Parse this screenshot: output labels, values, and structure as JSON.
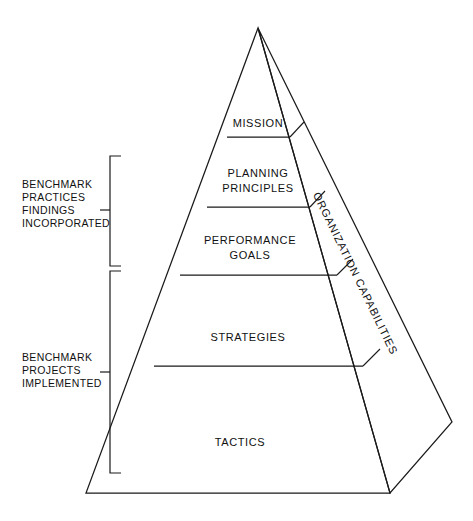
{
  "diagram": {
    "type": "pyramid-hierarchy",
    "tiers": [
      {
        "id": "mission",
        "label": "MISSION",
        "lines": [
          "MISSION"
        ],
        "level": 1
      },
      {
        "id": "planning",
        "label": "PLANNING PRINCIPLES",
        "lines": [
          "PLANNING",
          "PRINCIPLES"
        ],
        "level": 2
      },
      {
        "id": "performance",
        "label": "PERFORMANCE GOALS",
        "lines": [
          "PERFORMANCE",
          "GOALS"
        ],
        "level": 3
      },
      {
        "id": "strategies",
        "label": "STRATEGIES",
        "lines": [
          "STRATEGIES"
        ],
        "level": 4
      },
      {
        "id": "tactics",
        "label": "TACTICS",
        "lines": [
          "TACTICS"
        ],
        "level": 5
      }
    ],
    "side_panel": {
      "id": "organization-capabilities",
      "label": "ORGANIZATION CAPABILITIES",
      "position": "right-face",
      "orientation": "rotated"
    },
    "brackets": [
      {
        "id": "benchmark-practices",
        "lines": [
          "BENCHMARK",
          "PRACTICES",
          "FINDINGS",
          "INCORPORATED"
        ],
        "spans_tiers": [
          "planning",
          "performance"
        ],
        "position": "left"
      },
      {
        "id": "benchmark-projects",
        "lines": [
          "BENCHMARK",
          "PROJECTS",
          "IMPLEMENTED"
        ],
        "spans_tiers": [
          "strategies",
          "tactics"
        ],
        "position": "left"
      }
    ],
    "colors": {
      "stroke": "#1a1a1a",
      "text": "#111111",
      "background": "#ffffff"
    }
  }
}
